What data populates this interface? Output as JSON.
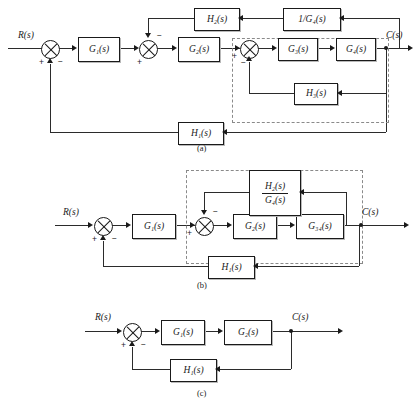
{
  "figure": {
    "kind": "control-system-block-diagram-reduction",
    "signals": {
      "input": "R(s)",
      "output": "C(s)"
    },
    "signs": {
      "plus": "+",
      "minus": "−"
    }
  },
  "diagram_a": {
    "caption": "(a)",
    "input_label": "R(s)",
    "output_label": "C(s)",
    "blocks": {
      "g1": "G₁(s)",
      "g2": "G₂(s)",
      "g3": "G₃(s)",
      "g4": "G₄(s)",
      "h1": "H₁(s)",
      "h2": "H₂(s)",
      "h3": "H₃(s)",
      "inv_g4": "1/G₄(s)"
    },
    "summers": [
      {
        "name": "outer-input-summer",
        "input_sign": "+",
        "feedback_sign": "−"
      },
      {
        "name": "h2-loop-summer",
        "input_sign": "+",
        "feedback_sign": "−"
      },
      {
        "name": "h3-inner-summer",
        "input_sign": "+",
        "feedback_sign": "−"
      }
    ]
  },
  "diagram_b": {
    "caption": "(b)",
    "input_label": "R(s)",
    "output_label": "C(s)",
    "blocks": {
      "g1": "G₁(s)",
      "g2": "G₂(s)",
      "g34": "G₃₄(s)",
      "h1": "H₁(s)",
      "h2_over_g4_num": "H₂(s)",
      "h2_over_g4_den": "G₄(s)"
    },
    "summers": [
      {
        "name": "outer-input-summer",
        "input_sign": "+",
        "feedback_sign": "−"
      },
      {
        "name": "inner-summer",
        "input_sign": "+",
        "feedback_sign": "−"
      }
    ]
  },
  "diagram_c": {
    "caption": "(c)",
    "input_label": "R(s)",
    "output_label": "C(s)",
    "blocks": {
      "g1": "G₁(s)",
      "g2": "G₂(s)",
      "h1": "H₁(s)"
    },
    "summers": [
      {
        "name": "input-summer",
        "input_sign": "+",
        "feedback_sign": "−"
      }
    ]
  }
}
